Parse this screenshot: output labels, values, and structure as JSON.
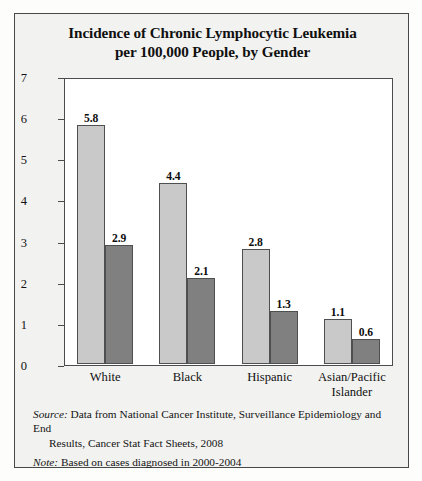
{
  "chart_data": {
    "type": "bar",
    "title": "Incidence of Chronic Lymphocytic Leukemia per 100,000 People, by Gender",
    "title_line1": "Incidence of Chronic Lymphocytic Leukemia",
    "title_line2": "per 100,000 People, by Gender",
    "xlabel": "",
    "ylabel": "",
    "ylim": [
      0,
      7
    ],
    "yticks": [
      0,
      1,
      2,
      3,
      4,
      5,
      6,
      7
    ],
    "ytick_labels": [
      "0",
      "1",
      "2",
      "3",
      "4",
      "5",
      "6",
      "7"
    ],
    "grid": false,
    "legend_position": "top-right",
    "categories": [
      "White",
      "Black",
      "Hispanic",
      "Asian/Pacific Islander"
    ],
    "category_lines": [
      [
        "White"
      ],
      [
        "Black"
      ],
      [
        "Hispanic"
      ],
      [
        "Asian/Pacific",
        "Islander"
      ]
    ],
    "series": [
      {
        "name": "Men",
        "color": "#c9c9c9",
        "values": [
          5.8,
          4.4,
          2.8,
          1.1
        ],
        "labels": [
          "5.8",
          "4.4",
          "2.8",
          "1.1"
        ]
      },
      {
        "name": "Women",
        "color": "#808080",
        "values": [
          2.9,
          2.1,
          1.3,
          0.6
        ],
        "labels": [
          "2.9",
          "2.1",
          "1.3",
          "0.6"
        ]
      }
    ]
  },
  "legend": {
    "entries": [
      {
        "label": "Men"
      },
      {
        "label": "Women"
      }
    ]
  },
  "footnotes": [
    {
      "label": "Source:",
      "text": " Data from National Cancer Institute, Surveillance Epidemiology and End",
      "continuation": "Results, Cancer Stat Fact Sheets, 2008"
    },
    {
      "label": "Note:",
      "text": " Based on cases diagnosed in 2000-2004",
      "continuation": ""
    }
  ]
}
